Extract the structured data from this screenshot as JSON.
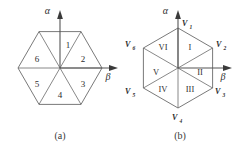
{
  "figure_a": {
    "caption": "(a)",
    "axis_alpha": "α",
    "axis_beta": "β",
    "hexagon_orientation": "flat-top",
    "sectors": [
      {
        "id": "1",
        "label": "1"
      },
      {
        "id": "2",
        "label": "2"
      },
      {
        "id": "3",
        "label": "3"
      },
      {
        "id": "4",
        "label": "4"
      },
      {
        "id": "5",
        "label": "5"
      },
      {
        "id": "6",
        "label": "6"
      }
    ]
  },
  "figure_b": {
    "caption": "(b)",
    "axis_alpha": "α",
    "axis_beta": "β",
    "hexagon_orientation": "pointy-top",
    "sectors": [
      {
        "id": "I",
        "label": "I"
      },
      {
        "id": "II",
        "label": "II"
      },
      {
        "id": "III",
        "label": "III"
      },
      {
        "id": "IV",
        "label": "IV"
      },
      {
        "id": "V",
        "label": "V"
      },
      {
        "id": "VI",
        "label": "VI"
      }
    ],
    "vertices": [
      {
        "id": "V1",
        "base": "V",
        "sub": "1"
      },
      {
        "id": "V2",
        "base": "V",
        "sub": "2"
      },
      {
        "id": "V3",
        "base": "V",
        "sub": "3"
      },
      {
        "id": "V4",
        "base": "V",
        "sub": "4"
      },
      {
        "id": "V5",
        "base": "V",
        "sub": "5"
      },
      {
        "id": "V6",
        "base": "V",
        "sub": "6"
      }
    ]
  },
  "colors": {
    "background": "#ffffff",
    "line": "#555555",
    "axis": "#4a4a4a",
    "text": "#2e2e2e"
  }
}
